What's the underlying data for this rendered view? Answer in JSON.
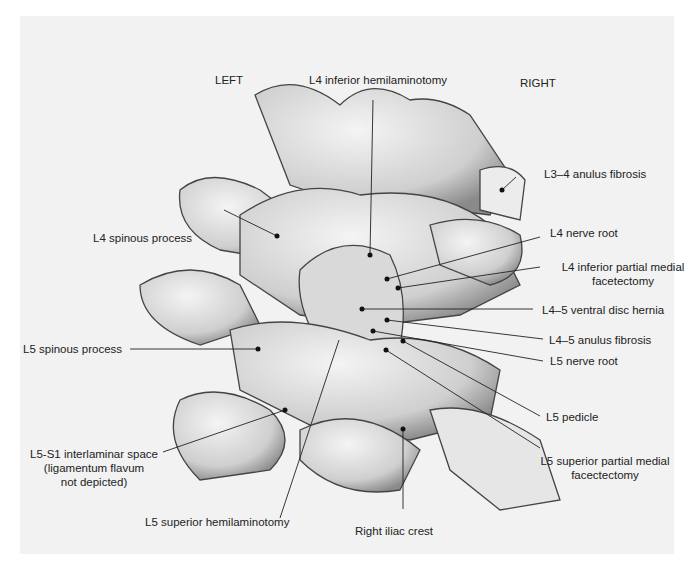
{
  "orientation": {
    "left": "LEFT",
    "right": "RIGHT"
  },
  "labels": {
    "l4_inferior_hemilaminotomy": "L4 inferior hemilaminotomy",
    "l3_4_anulus": "L3–4 anulus fibrosis",
    "l4_spinous": "L4 spinous process",
    "l4_nerve_root": "L4 nerve root",
    "l4_facetectomy_1": "L4 inferior partial medial",
    "l4_facetectomy_2": "facetectomy",
    "l4_5_hernia": "L4–5 ventral disc hernia",
    "l5_spinous": "L5 spinous process",
    "l4_5_anulus": "L4–5 anulus fibrosis",
    "l5_nerve_root": "L5 nerve root",
    "l5_pedicle": "L5 pedicle",
    "interlaminar_1": "L5-S1 interlaminar space",
    "interlaminar_2": "(ligamentum flavum",
    "interlaminar_3": "not depicted)",
    "l5_facetectomy_1": "L5 superior partial medial",
    "l5_facetectomy_2": "facectectomy",
    "l5_hemilaminotomy": "L5 superior hemilaminotomy",
    "iliac_crest": "Right iliac crest"
  },
  "colors": {
    "panel": "#f2f2f2",
    "bone": "#e2e2e2",
    "shade": "#9a9a9a",
    "outline": "#444444",
    "text": "#222222"
  }
}
